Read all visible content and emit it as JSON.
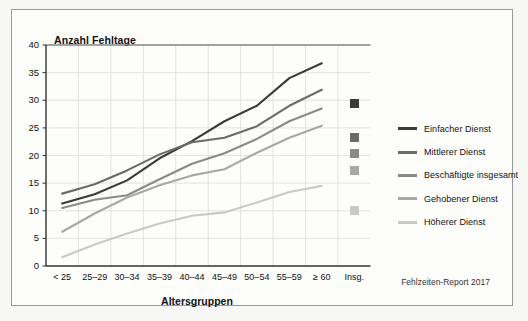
{
  "frame": {
    "footer_note": "Fehlzeiten-Report 2017"
  },
  "chart_data": {
    "type": "line",
    "title": "Anzahl Fehltage",
    "xlabel": "Altersgruppen",
    "ylabel": "Anzahl Fehltage",
    "ylim": [
      0,
      40
    ],
    "yticks": [
      0,
      5,
      10,
      15,
      20,
      25,
      30,
      35,
      40
    ],
    "grid": true,
    "legend_position": "right",
    "categories": [
      "< 25",
      "25–29",
      "30–34",
      "35–39",
      "40–44",
      "45–49",
      "50–54",
      "55–59",
      "≥ 60"
    ],
    "extra_category": "Insg.",
    "series": [
      {
        "name": "Einfacher Dienst",
        "color": "#3a3a3a",
        "values": [
          11.3,
          13.0,
          15.5,
          19.5,
          22.6,
          26.2,
          29.0,
          34.0,
          36.7
        ],
        "total": 29.5
      },
      {
        "name": "Mittlerer Dienst",
        "color": "#6b6b6b",
        "values": [
          13.1,
          14.8,
          17.3,
          20.2,
          22.4,
          23.2,
          25.3,
          29.0,
          31.9
        ],
        "total": 23.2
      },
      {
        "name": "Beschäftigte insgesamt",
        "color": "#8a8a8a",
        "values": [
          10.5,
          12.0,
          12.8,
          15.7,
          18.5,
          20.4,
          23.0,
          26.2,
          28.5
        ],
        "total": 20.3
      },
      {
        "name": "Gehobener Dienst",
        "color": "#a8a8a8",
        "values": [
          6.2,
          9.5,
          12.4,
          14.6,
          16.4,
          17.5,
          20.5,
          23.2,
          25.4
        ],
        "total": 17.3
      },
      {
        "name": "Höherer Dienst",
        "color": "#c9c9c9",
        "values": [
          1.6,
          3.9,
          5.9,
          7.7,
          9.1,
          9.7,
          11.5,
          13.4,
          14.5
        ],
        "total": 10.0
      }
    ]
  }
}
